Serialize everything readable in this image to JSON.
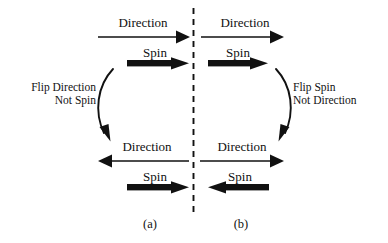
{
  "figure": {
    "background_color": "#ffffff",
    "ink_color": "#111111",
    "width": 388,
    "height": 243
  },
  "divider": {
    "name": "vertical-dashed-divider",
    "style": "dashed",
    "orientation": "vertical"
  },
  "panels": [
    {
      "id": "a",
      "caption": "(a)",
      "note_line1": "Flip Direction",
      "note_line2": "Not Spin",
      "note_align": "right",
      "top": {
        "direction_label": "Direction",
        "direction_arrow": "right",
        "spin_label": "Spin",
        "spin_arrow": "right"
      },
      "bottom": {
        "direction_label": "Direction",
        "direction_arrow": "left",
        "spin_label": "Spin",
        "spin_arrow": "right"
      }
    },
    {
      "id": "b",
      "caption": "(b)",
      "note_line1": "Flip Spin",
      "note_line2": "Not Direction",
      "note_align": "left",
      "top": {
        "direction_label": "Direction",
        "direction_arrow": "right",
        "spin_label": "Spin",
        "spin_arrow": "right"
      },
      "bottom": {
        "direction_label": "Direction",
        "direction_arrow": "right",
        "spin_label": "Spin",
        "spin_arrow": "left"
      }
    }
  ]
}
